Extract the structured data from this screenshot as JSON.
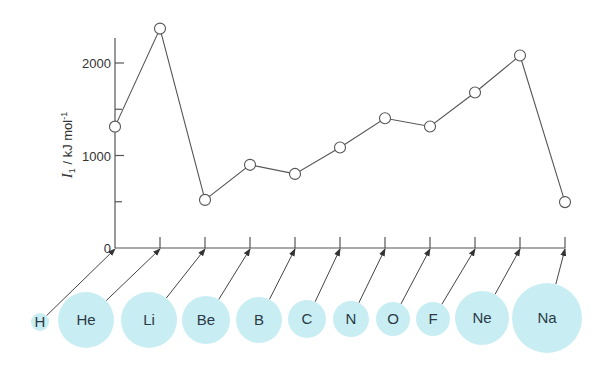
{
  "chart_data": {
    "type": "line",
    "title": "",
    "xlabel": "",
    "ylabel": "I1 / kJ mol-1",
    "ylabel_parts": {
      "symbol": "I",
      "subscript": "1",
      "unit": " / kJ mol",
      "superscript": "-1"
    },
    "ylim": [
      0,
      2400
    ],
    "yticks": [
      0,
      1000,
      2000
    ],
    "yminor_ticks": [
      500,
      1500
    ],
    "ytick_labels": [
      "0",
      "1000",
      "2000"
    ],
    "grid": false,
    "categories": [
      "H",
      "He",
      "Li",
      "Be",
      "B",
      "C",
      "N",
      "O",
      "F",
      "Ne",
      "Na"
    ],
    "series": [
      {
        "name": "First ionization energy",
        "values": [
          1312,
          2372,
          520,
          899,
          801,
          1086,
          1402,
          1314,
          1681,
          2081,
          496
        ],
        "marker": "open-circle",
        "color": "#555555"
      }
    ],
    "atom_circles": {
      "color": "#c8eef4",
      "relative_radius": [
        9,
        28,
        28,
        24,
        23,
        19,
        18,
        17,
        17,
        27,
        35
      ]
    }
  },
  "colors": {
    "line": "#555555",
    "axis": "#555555",
    "circle_fill": "#c8eef4",
    "text": "#333333"
  }
}
